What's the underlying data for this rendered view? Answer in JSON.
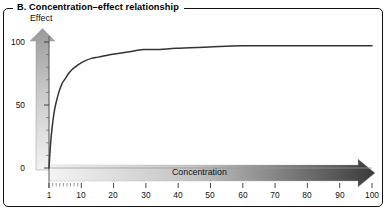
{
  "panel": {
    "title": "B. Concentration–effect relationship"
  },
  "axes": {
    "y_title": "Effect",
    "x_title": "Concentration",
    "y_ticks": [
      "0",
      "50",
      "100"
    ],
    "x_ticks": [
      "1",
      "10",
      "20",
      "30",
      "40",
      "50",
      "60",
      "70",
      "80",
      "90",
      "100"
    ]
  },
  "colors": {
    "frame": "#111111",
    "curve": "#333333",
    "arrow_light": "#f0f0f0",
    "arrow_dark": "#3a3a3a",
    "tick": "#555555"
  },
  "chart_data": {
    "type": "line",
    "title": "B. Concentration–effect relationship",
    "xlabel": "Concentration",
    "ylabel": "Effect",
    "xlim": [
      1,
      100
    ],
    "ylim": [
      0,
      100
    ],
    "grid": false,
    "legend": "none",
    "x_tick_values": [
      1,
      10,
      20,
      30,
      40,
      50,
      60,
      70,
      80,
      90,
      100
    ],
    "y_tick_values": [
      0,
      50,
      100
    ],
    "x_minor_ticks": [
      2,
      3,
      4,
      5,
      6,
      7,
      8,
      9
    ],
    "annotations": [
      "Effect axis drawn as an upward gradient arrow",
      "Concentration axis drawn as a rightward gradient arrow"
    ],
    "series": [
      {
        "name": "Concentration–effect curve",
        "model": "hyperbolic Emax: E = 100 * (c-1) / ((c-1) + 2)",
        "x": [
          1,
          1.5,
          2,
          2.5,
          3,
          4,
          5,
          6,
          7,
          8,
          9,
          10,
          12,
          14,
          16,
          18,
          20,
          25,
          30,
          35,
          40,
          50,
          60,
          70,
          80,
          90,
          100
        ],
        "y": [
          0,
          20,
          33,
          43,
          50,
          60,
          67,
          71,
          75,
          78,
          80,
          82,
          85,
          87,
          88,
          89,
          90,
          92,
          94,
          94,
          95,
          96,
          97,
          97,
          97,
          97,
          97
        ]
      }
    ]
  }
}
